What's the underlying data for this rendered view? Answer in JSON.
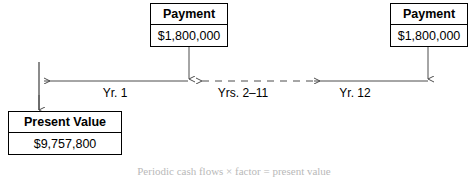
{
  "diagram": {
    "title_caption": "Periodic cash flows × factor = present value",
    "colors": {
      "line": "#4d4d4d",
      "border": "#000000",
      "background": "#ffffff",
      "caption": "#b9b9b9"
    },
    "boxes": [
      {
        "id": "payment-left",
        "header": "Payment",
        "value": "$1,800,000"
      },
      {
        "id": "payment-right",
        "header": "Payment",
        "value": "$1,800,000"
      },
      {
        "id": "present-value",
        "header": "Present Value",
        "value": "$9,757,800"
      }
    ],
    "timeline": {
      "labels": [
        {
          "id": "yr-1",
          "text": "Yr. 1"
        },
        {
          "id": "yrs-2-11",
          "text": "Yrs. 2–11"
        },
        {
          "id": "yr-12",
          "text": "Yr. 12"
        }
      ],
      "segments": [
        {
          "id": "segment-yr-1",
          "style": "solid",
          "direction": "left"
        },
        {
          "id": "segment-yrs-2-11",
          "style": "dashed",
          "direction": "left"
        },
        {
          "id": "segment-yr-12",
          "style": "solid",
          "direction": "left"
        }
      ]
    }
  }
}
